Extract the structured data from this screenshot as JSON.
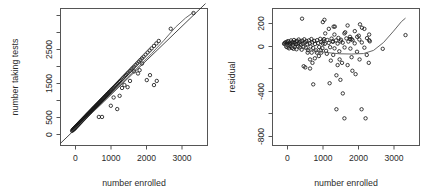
{
  "figure": {
    "type": "regression-diagnostic-panel",
    "panel_count": 2,
    "background_color": "#ffffff",
    "point_color": "#1a1a1a",
    "curve_color": "#555555",
    "axis_color": "#555555"
  },
  "chart_data": [
    {
      "id": "fitted-vs-enrolled",
      "type": "scatter",
      "title": "",
      "xlabel": "number enrolled",
      "ylabel": "number taking tests",
      "xlim": [
        -180,
        3500
      ],
      "ylim": [
        -260,
        3050
      ],
      "xticks": [
        0,
        1000,
        2000,
        3000
      ],
      "xticklabels": [
        "0",
        "1000",
        "2000",
        "3000"
      ],
      "yticks": [
        0,
        500,
        1500,
        2500
      ],
      "yticklabels": [
        "0",
        "500",
        "1500",
        "2500"
      ],
      "grid": false,
      "legend": "none",
      "annotations": [
        {
          "kind": "reference-line",
          "description": "straight identity-like regression line through the cloud"
        },
        {
          "kind": "loess-curve",
          "description": "smoothed fit bending above the straight line beyond x = 2500"
        }
      ],
      "x": [
        110,
        125,
        132,
        140,
        148,
        152,
        158,
        163,
        168,
        172,
        176,
        180,
        185,
        188,
        192,
        196,
        200,
        204,
        208,
        212,
        216,
        220,
        224,
        228,
        232,
        236,
        240,
        244,
        248,
        252,
        256,
        260,
        264,
        268,
        272,
        276,
        280,
        284,
        288,
        292,
        296,
        300,
        304,
        308,
        312,
        316,
        320,
        324,
        328,
        332,
        336,
        340,
        345,
        350,
        355,
        360,
        365,
        370,
        375,
        380,
        385,
        390,
        395,
        400,
        405,
        410,
        415,
        420,
        425,
        430,
        436,
        442,
        448,
        454,
        460,
        466,
        472,
        478,
        484,
        490,
        496,
        502,
        508,
        514,
        520,
        527,
        534,
        541,
        548,
        555,
        562,
        569,
        576,
        583,
        590,
        598,
        606,
        614,
        622,
        630,
        638,
        646,
        654,
        662,
        670,
        680,
        690,
        700,
        710,
        720,
        730,
        740,
        750,
        762,
        774,
        786,
        798,
        810,
        822,
        834,
        846,
        858,
        870,
        884,
        898,
        912,
        926,
        940,
        955,
        970,
        985,
        1000,
        1015,
        1030,
        1045,
        1060,
        1080,
        1100,
        1120,
        1140,
        1160,
        1185,
        1210,
        1235,
        1260,
        1285,
        1310,
        1340,
        1370,
        1400,
        1430,
        1460,
        1490,
        1520,
        1555,
        1590,
        1625,
        1660,
        1700,
        1740,
        1780,
        1820,
        1860,
        1900,
        1950,
        2000,
        2050,
        2100,
        2160,
        2220,
        2280,
        2580,
        3150,
        780,
        860,
        1080,
        1150,
        1240,
        1300,
        1360,
        1420,
        1500,
        1560,
        1660,
        1760,
        1800,
        1860,
        1980,
        2060,
        2160,
        2230
      ],
      "y": [
        95,
        110,
        118,
        125,
        132,
        138,
        143,
        148,
        152,
        156,
        160,
        165,
        170,
        174,
        178,
        182,
        186,
        190,
        194,
        198,
        202,
        206,
        210,
        214,
        218,
        222,
        226,
        230,
        234,
        238,
        242,
        246,
        250,
        254,
        258,
        262,
        266,
        270,
        274,
        278,
        282,
        286,
        290,
        294,
        298,
        302,
        306,
        310,
        314,
        318,
        322,
        326,
        331,
        336,
        341,
        346,
        351,
        356,
        361,
        366,
        371,
        376,
        381,
        386,
        391,
        396,
        401,
        406,
        411,
        416,
        422,
        428,
        434,
        440,
        446,
        452,
        458,
        464,
        470,
        476,
        482,
        488,
        494,
        500,
        506,
        513,
        520,
        527,
        534,
        541,
        548,
        555,
        562,
        569,
        576,
        584,
        592,
        600,
        608,
        616,
        624,
        632,
        640,
        648,
        656,
        666,
        676,
        686,
        696,
        706,
        716,
        726,
        736,
        748,
        760,
        772,
        784,
        796,
        808,
        820,
        832,
        844,
        856,
        870,
        884,
        898,
        912,
        926,
        941,
        956,
        971,
        986,
        1001,
        1016,
        1031,
        1046,
        1066,
        1086,
        1106,
        1126,
        1146,
        1171,
        1196,
        1221,
        1246,
        1271,
        1296,
        1326,
        1356,
        1386,
        1416,
        1446,
        1476,
        1506,
        1541,
        1576,
        1611,
        1646,
        1686,
        1726,
        1766,
        1806,
        1846,
        1886,
        1936,
        1986,
        2036,
        2086,
        2146,
        2206,
        2266,
        2560,
        2940,
        430,
        430,
        700,
        900,
        620,
        940,
        1130,
        1200,
        1150,
        1300,
        1530,
        1480,
        1560,
        1720,
        1320,
        1440,
        1200,
        1300
      ]
    },
    {
      "id": "residual-vs-enrolled",
      "type": "scatter",
      "title": "",
      "xlabel": "number enrolled",
      "ylabel": "residual",
      "xlim": [
        -180,
        3500
      ],
      "ylim": [
        -880,
        330
      ],
      "xticks": [
        0,
        1000,
        2000,
        3000
      ],
      "xticklabels": [
        "0",
        "1000",
        "2000",
        "3000"
      ],
      "yticks": [
        -800,
        -600,
        -400,
        -200,
        0,
        200
      ],
      "yticklabels": [
        "-800",
        "",
        "-400",
        "",
        "0",
        "200"
      ],
      "labeled_yticks": [
        -800,
        -400,
        0,
        200
      ],
      "grid": false,
      "legend": "none",
      "annotations": [
        {
          "kind": "loess-curve",
          "description": "smoother flat near zero then rising steeply past x = 2400"
        }
      ],
      "x": [
        110,
        125,
        140,
        152,
        165,
        176,
        188,
        200,
        212,
        224,
        236,
        248,
        260,
        272,
        284,
        296,
        308,
        320,
        332,
        345,
        358,
        370,
        382,
        395,
        408,
        420,
        434,
        448,
        462,
        476,
        490,
        504,
        518,
        534,
        550,
        566,
        582,
        598,
        616,
        634,
        652,
        670,
        690,
        710,
        730,
        750,
        772,
        794,
        816,
        838,
        862,
        886,
        910,
        936,
        962,
        988,
        1014,
        1042,
        1070,
        1100,
        1130,
        1162,
        1194,
        1228,
        1262,
        1298,
        1334,
        1372,
        1410,
        1450,
        1492,
        1534,
        1578,
        1624,
        1670,
        1720,
        1770,
        1824,
        1878,
        1936,
        1994,
        2056,
        2120,
        2186,
        2256,
        2580,
        3150,
        560,
        600,
        640,
        700,
        760,
        820,
        880,
        930,
        980,
        1030,
        1080,
        1110,
        1140,
        1180,
        1230,
        1280,
        1320,
        1370,
        1420,
        1470,
        1520,
        1580,
        1640,
        1700,
        1760,
        1820,
        1880,
        1940,
        2000,
        2060,
        2120,
        2180,
        2240,
        1040,
        1080,
        1120,
        1350,
        1420,
        1500,
        1560,
        1620,
        1700,
        1800,
        1900,
        1980,
        2050,
        2150,
        2230,
        760,
        800,
        840,
        1250,
        1340,
        1380,
        1450,
        1520,
        1620,
        1760,
        1800,
        2010,
        2240
      ],
      "y": [
        18,
        24,
        30,
        12,
        -8,
        36,
        20,
        -14,
        42,
        8,
        -22,
        30,
        16,
        -6,
        48,
        22,
        -18,
        34,
        10,
        -26,
        52,
        26,
        -10,
        38,
        14,
        -30,
        44,
        18,
        -4,
        56,
        28,
        -14,
        40,
        12,
        -34,
        46,
        20,
        -8,
        58,
        30,
        -16,
        42,
        14,
        -38,
        48,
        22,
        -6,
        60,
        32,
        -18,
        44,
        16,
        -40,
        50,
        24,
        -10,
        62,
        34,
        -20,
        46,
        18,
        -44,
        52,
        26,
        -12,
        64,
        36,
        -22,
        48,
        20,
        -48,
        54,
        28,
        -14,
        66,
        38,
        -24,
        50,
        22,
        -52,
        56,
        30,
        -16,
        68,
        40,
        -26,
        95,
        240,
        -180,
        -190,
        -60,
        -120,
        -150,
        -110,
        -60,
        -90,
        -40,
        20,
        60,
        110,
        -70,
        150,
        -130,
        40,
        100,
        -260,
        70,
        -300,
        -420,
        120,
        -170,
        60,
        -220,
        130,
        80,
        -120,
        160,
        150,
        -80,
        100,
        -60,
        210,
        230,
        170,
        -560,
        -120,
        -150,
        -640,
        180,
        60,
        -250,
        90,
        -560,
        -640,
        -150,
        -200,
        -60,
        -340,
        -330,
        -80,
        170,
        -170,
        40,
        110,
        80,
        -100,
        190,
        50,
        140,
        60
      ]
    }
  ],
  "panels": [
    {
      "name": "left-panel",
      "ylabel": "number taking tests",
      "xlabel": "number enrolled",
      "xticklabels": [
        "0",
        "1000",
        "2000",
        "3000"
      ],
      "yticklabels": [
        "0",
        "500",
        "1500",
        "2500"
      ]
    },
    {
      "name": "right-panel",
      "ylabel": "residual",
      "xlabel": "number enrolled",
      "xticklabels": [
        "0",
        "1000",
        "2000",
        "3000"
      ],
      "yticklabels": [
        "-800",
        "-400",
        "0",
        "200"
      ]
    }
  ]
}
